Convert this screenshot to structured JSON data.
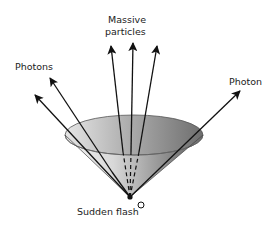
{
  "diagram": {
    "labels": {
      "massive_line1": "Massive",
      "massive_line2": "particles",
      "photons_left": "Photons",
      "photon_right": "Photon",
      "origin": "Sudden flash",
      "origin_marker": "O"
    },
    "colors": {
      "arrow": "#111111",
      "cone_light": "#f2f2f2",
      "cone_dark": "#6a6a6a",
      "rim": "#555555"
    },
    "arrows": [
      {
        "name": "photon-left-outer",
        "from": [
          130,
          197
        ],
        "to": [
          35,
          95
        ]
      },
      {
        "name": "photon-left-inner",
        "from": [
          130,
          197
        ],
        "to": [
          50,
          78
        ]
      },
      {
        "name": "massive-left",
        "from": [
          130,
          197
        ],
        "to": [
          111,
          46
        ]
      },
      {
        "name": "massive-center",
        "from": [
          130,
          197
        ],
        "to": [
          133,
          43
        ]
      },
      {
        "name": "massive-right",
        "from": [
          130,
          197
        ],
        "to": [
          157,
          46
        ]
      },
      {
        "name": "photon-right",
        "from": [
          130,
          197
        ],
        "to": [
          240,
          91
        ]
      }
    ]
  }
}
